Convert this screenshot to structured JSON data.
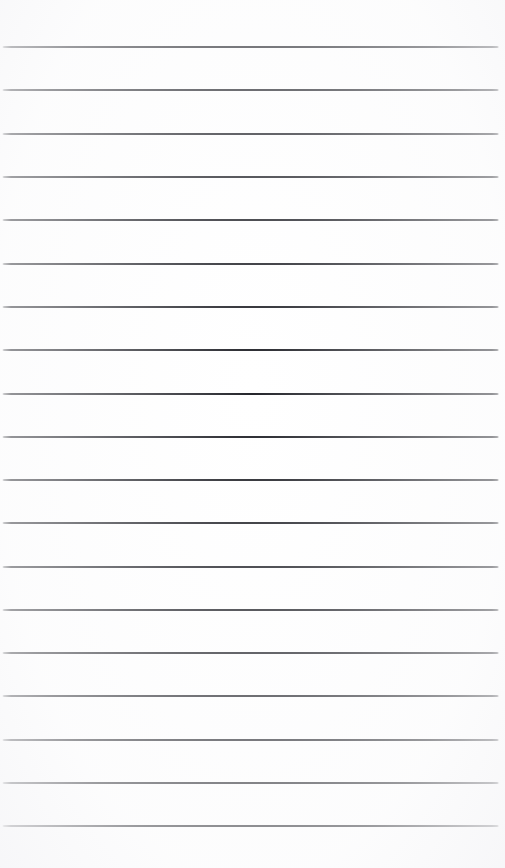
{
  "document": {
    "kind": "ruled-paper",
    "title": "Blank ruled paper",
    "description": "Blank lined notebook page with evenly spaced horizontal rules and no written content.",
    "width_px": 505,
    "height_px": 868,
    "background_color": "#ffffff",
    "rule_color": "#23242a",
    "rule_thickness_px": 2,
    "rule_count": 19,
    "rule_spacing_px": 43.3,
    "first_rule_y_px": 47,
    "last_rule_y_px": 826,
    "rule_start_x_px": 2,
    "rule_end_x_px": 499,
    "top_margin_px": 47,
    "bottom_margin_px": 42,
    "has_text_content": false,
    "has_margin_rule": false,
    "has_holes": false,
    "rules": [
      {
        "index": 1,
        "y": 47,
        "x1": 2,
        "x2": 499
      },
      {
        "index": 2,
        "y": 90,
        "x1": 2,
        "x2": 499
      },
      {
        "index": 3,
        "y": 134,
        "x1": 2,
        "x2": 499
      },
      {
        "index": 4,
        "y": 177,
        "x1": 2,
        "x2": 499
      },
      {
        "index": 5,
        "y": 220,
        "x1": 2,
        "x2": 499
      },
      {
        "index": 6,
        "y": 264,
        "x1": 2,
        "x2": 499
      },
      {
        "index": 7,
        "y": 307,
        "x1": 2,
        "x2": 499
      },
      {
        "index": 8,
        "y": 350,
        "x1": 2,
        "x2": 499
      },
      {
        "index": 9,
        "y": 394,
        "x1": 2,
        "x2": 499
      },
      {
        "index": 10,
        "y": 437,
        "x1": 2,
        "x2": 499
      },
      {
        "index": 11,
        "y": 480,
        "x1": 2,
        "x2": 499
      },
      {
        "index": 12,
        "y": 523,
        "x1": 2,
        "x2": 499
      },
      {
        "index": 13,
        "y": 567,
        "x1": 2,
        "x2": 499
      },
      {
        "index": 14,
        "y": 610,
        "x1": 2,
        "x2": 499
      },
      {
        "index": 15,
        "y": 653,
        "x1": 2,
        "x2": 499
      },
      {
        "index": 16,
        "y": 696,
        "x1": 2,
        "x2": 499
      },
      {
        "index": 17,
        "y": 740,
        "x1": 2,
        "x2": 499
      },
      {
        "index": 18,
        "y": 783,
        "x1": 2,
        "x2": 499
      },
      {
        "index": 19,
        "y": 826,
        "x1": 2,
        "x2": 499
      }
    ],
    "lines_text": [
      "",
      "",
      "",
      "",
      "",
      "",
      "",
      "",
      "",
      "",
      "",
      "",
      "",
      "",
      "",
      "",
      "",
      "",
      "",
      ""
    ]
  }
}
